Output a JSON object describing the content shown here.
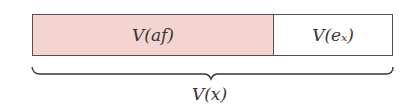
{
  "diagram": {
    "segments": [
      {
        "label": "V(af)",
        "fill": "#f4d4d0"
      },
      {
        "label": "V(eₓ)",
        "fill": "#ffffff"
      }
    ],
    "total_label": "V(x)",
    "border_color": "#5a4f4a"
  }
}
